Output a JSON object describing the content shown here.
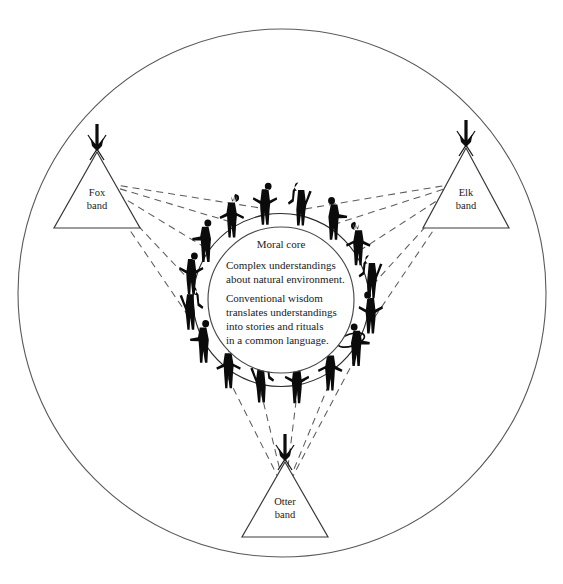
{
  "diagram": {
    "background_color": "#ffffff",
    "ink_color": "#0b0b0b",
    "line_color": "#5a5a5a"
  },
  "outer_circle": {
    "name": "society-boundary",
    "cx": 282,
    "cy": 293,
    "r": 264
  },
  "core": {
    "cx": 281,
    "cy": 300,
    "r": 73,
    "title": "Moral core",
    "paragraphs": [
      [
        "Complex understandings",
        "about natural environment."
      ],
      [
        "Conventional wisdom",
        "translates understandings",
        "into stories and rituals",
        "in a common language."
      ]
    ],
    "lines": [
      "Complex understandings",
      "about natural environment.",
      "Conventional wisdom",
      "translates understandings",
      "into stories and rituals",
      "in a common language."
    ]
  },
  "bands": [
    {
      "id": "fox",
      "label_line1": "Fox",
      "label_line2": "band",
      "apex_x": 97,
      "apex_y": 152,
      "base_y": 228,
      "half_width": 43,
      "icon": "teepee-icon"
    },
    {
      "id": "elk",
      "label_line1": "Elk",
      "label_line2": "band",
      "apex_x": 466,
      "apex_y": 148,
      "base_y": 228,
      "half_width": 43,
      "icon": "teepee-icon"
    },
    {
      "id": "otter",
      "label_line1": "Otter",
      "label_line2": "band",
      "apex_x": 285,
      "apex_y": 462,
      "base_y": 537,
      "half_width": 43,
      "icon": "teepee-icon"
    }
  ],
  "figures_count": 16,
  "figure_ring": {
    "cx": 281,
    "cy": 300,
    "r": 88,
    "note": "silhouetted people holding hands / arms linked around the moral core"
  },
  "connections": {
    "style": "dashed",
    "description": "dashed lines fan out from each band teepee to people in the ring"
  }
}
